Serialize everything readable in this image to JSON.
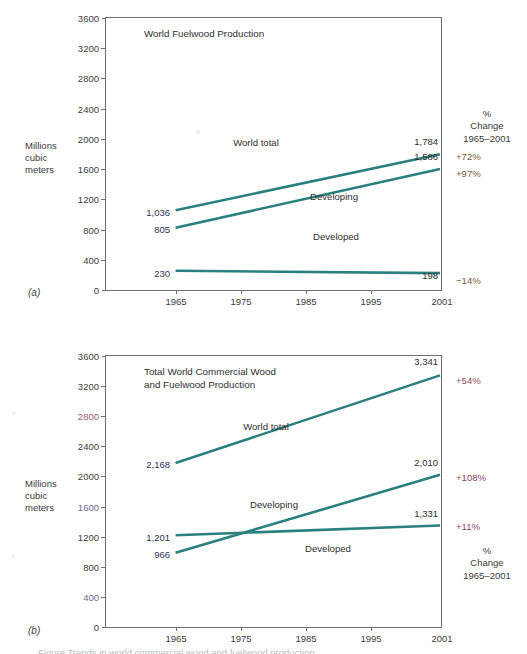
{
  "figure": {
    "axis_label_line1": "Millions",
    "axis_label_line2": "cubic",
    "axis_label_line3": "meters",
    "panel_a_letter": "(a)",
    "panel_b_letter": "(b)",
    "line_color": "#2a7f7f",
    "frame_color": "#6f6f6f",
    "caption_partial": "Figure   Trends in world commercial wood and fuelwood production"
  },
  "pct_header": {
    "line1": "%",
    "line2": "Change",
    "line3": "1965–2001"
  },
  "y_axis": {
    "ticks": [
      "0",
      "400",
      "800",
      "1200",
      "1600",
      "2000",
      "2400",
      "2800",
      "3200",
      "3600"
    ],
    "min": 0,
    "max": 3600,
    "step": 400
  },
  "x_axis": {
    "ticks": [
      "1965",
      "1975",
      "1985",
      "1995",
      "2001"
    ],
    "values": [
      1965,
      1975,
      1985,
      1995,
      2001
    ],
    "min": 1960,
    "max": 2003
  },
  "chart_data": [
    {
      "id": "a",
      "type": "line",
      "title": "World Fuelwood Production",
      "title_lines": [
        "World Fuelwood Production"
      ],
      "ylabel": "Millions cubic meters",
      "xlabel": "",
      "ylim": [
        0,
        3600
      ],
      "xlim": [
        1960,
        2003
      ],
      "grid": false,
      "legend": "inline-annotation",
      "x": [
        1965,
        2001
      ],
      "series": [
        {
          "name": "World total",
          "values": [
            1036,
            1784
          ],
          "start_label": "1,036",
          "end_label": "1,784",
          "pct_change": "+72%"
        },
        {
          "name": "Developing",
          "values": [
            805,
            1586
          ],
          "start_label": "805",
          "end_label": "1,586",
          "pct_change": "+97%"
        },
        {
          "name": "Developed",
          "values": [
            230,
            198
          ],
          "start_label": "230",
          "end_label": "198",
          "pct_change": "−14%"
        }
      ]
    },
    {
      "id": "b",
      "type": "line",
      "title": "Total World Commercial Wood and Fuelwood Production",
      "title_lines": [
        "Total World Commercial Wood",
        "and Fuelwood Production"
      ],
      "ylabel": "Millions cubic meters",
      "xlabel": "",
      "ylim": [
        0,
        3600
      ],
      "xlim": [
        1960,
        2003
      ],
      "grid": false,
      "legend": "inline-annotation",
      "x": [
        1965,
        2001
      ],
      "series": [
        {
          "name": "World total",
          "values": [
            2168,
            3341
          ],
          "start_label": "2,168",
          "end_label": "3,341",
          "pct_change": "+54%"
        },
        {
          "name": "Developing",
          "values": [
            966,
            2010
          ],
          "start_label": "966",
          "end_label": "2,010",
          "pct_change": "+108%"
        },
        {
          "name": "Developed",
          "values": [
            1201,
            1331
          ],
          "start_label": "1,201",
          "end_label": "1,331",
          "pct_change": "+11%"
        }
      ]
    }
  ]
}
